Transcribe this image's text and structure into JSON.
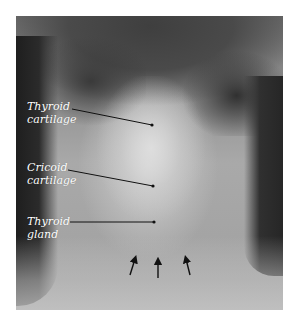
{
  "figure": {
    "labels": [
      {
        "line1": "Thyroid",
        "line2": "cartilage",
        "x": 27,
        "y": 100,
        "line": {
          "x1": 72,
          "y1": 109,
          "x2": 152,
          "y2": 125
        }
      },
      {
        "line1": "Cricoid",
        "line2": "cartilage",
        "x": 27,
        "y": 161,
        "line": {
          "x1": 68,
          "y1": 170,
          "x2": 153,
          "y2": 186
        }
      },
      {
        "line1": "Thyroid",
        "line2": "gland",
        "x": 27,
        "y": 215,
        "line": {
          "x1": 70,
          "y1": 222,
          "x2": 154,
          "y2": 222
        }
      }
    ],
    "arrows": [
      {
        "x1": 130,
        "y1": 275,
        "x2": 135,
        "y2": 259
      },
      {
        "x1": 158,
        "y1": 278,
        "x2": 158,
        "y2": 261
      },
      {
        "x1": 190,
        "y1": 275,
        "x2": 186,
        "y2": 259
      }
    ],
    "colors": {
      "label_text": "#ffffff",
      "leader_line": "#111111",
      "background": "#ffffff"
    }
  }
}
